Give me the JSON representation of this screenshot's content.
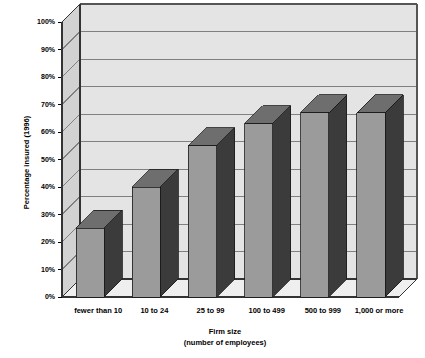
{
  "chart_data": {
    "type": "bar",
    "title": "",
    "subtitle": "",
    "xlabel": "Firm size",
    "xlabel_line2": "(number of employees)",
    "ylabel": "Percentage insured (1996)",
    "categories": [
      "fewer than 10",
      "10 to 24",
      "25 to 99",
      "100 to 499",
      "500 to 999",
      "1,000 or more"
    ],
    "values": [
      25,
      40,
      55,
      63,
      67,
      67
    ],
    "value_labels": [
      "25%",
      "40%",
      "55%",
      "63%",
      "67%",
      "67%"
    ],
    "ylim": [
      0,
      100
    ],
    "ytick_values": [
      0,
      10,
      20,
      30,
      40,
      50,
      60,
      70,
      80,
      90,
      100
    ],
    "ytick_labels": [
      "0%",
      "10%",
      "20%",
      "30%",
      "40%",
      "50%",
      "60%",
      "70%",
      "80%",
      "90%",
      "100%"
    ],
    "grid": true,
    "grid_axis": "y",
    "legend": false,
    "legend_position": "none",
    "three_d": true,
    "series": [
      {
        "name": "Percentage insured (1996)",
        "values": [
          25,
          40,
          55,
          63,
          67,
          67
        ]
      }
    ]
  },
  "colors": {
    "bar_front": "#9b9b9b",
    "bar_side": "#3b3b3b",
    "bar_top": "#6e6e6e",
    "wall_back": "#e4e4e4",
    "wall_left": "#d2d2d2",
    "floor": "#efefef",
    "gridline": "#808080",
    "axis_line": "#000000",
    "text": "#000000",
    "background": "#ffffff"
  }
}
